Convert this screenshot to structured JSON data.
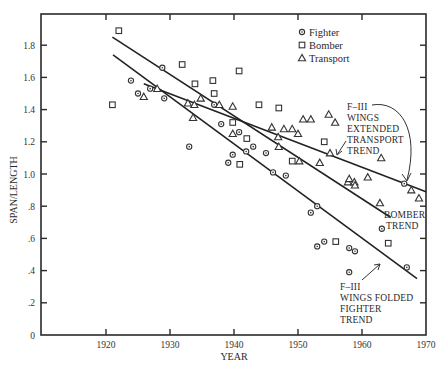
{
  "chart_data": {
    "type": "scatter",
    "title": "",
    "xlabel": "YEAR",
    "ylabel": "SPAN/LENGTH",
    "xlim": [
      1912.5,
      1970
    ],
    "ylim": [
      0,
      1.99
    ],
    "x_ticks": [
      1920,
      1930,
      1940,
      1950,
      1960,
      1970
    ],
    "x_tick_labels": [
      "1920",
      "1930",
      "1940",
      "1950",
      "1960",
      "1970"
    ],
    "y_ticks": [
      0,
      0.2,
      0.4,
      0.6,
      0.8,
      1.0,
      1.2,
      1.4,
      1.6,
      1.8
    ],
    "y_tick_labels": [
      "0",
      ".2",
      ".4",
      ".6",
      ".8",
      "1.0",
      "1.2",
      "1.4",
      "1.6",
      "1.8"
    ],
    "grid": false,
    "legend_position": "upper right (inside)",
    "legend": [
      {
        "name": "Fighter",
        "marker": "circle-dot"
      },
      {
        "name": "Bomber",
        "marker": "square"
      },
      {
        "name": "Transport",
        "marker": "triangle"
      }
    ],
    "series": [
      {
        "name": "Fighter",
        "marker": "circle-dot",
        "points": [
          [
            1923.9,
            1.58
          ],
          [
            1925.0,
            1.5
          ],
          [
            1926.9,
            1.53
          ],
          [
            1928.8,
            1.66
          ],
          [
            1929.1,
            1.47
          ],
          [
            1933.0,
            1.17
          ],
          [
            1936.9,
            1.43
          ],
          [
            1938.0,
            1.31
          ],
          [
            1940.8,
            1.26
          ],
          [
            1943.0,
            1.17
          ],
          [
            1939.8,
            1.12
          ],
          [
            1941.9,
            1.14
          ],
          [
            1939.1,
            1.07
          ],
          [
            1945.0,
            1.13
          ],
          [
            1946.1,
            1.01
          ],
          [
            1948.1,
            0.99
          ],
          [
            1952.0,
            0.76
          ],
          [
            1953.0,
            0.8
          ],
          [
            1953.0,
            0.55
          ],
          [
            1954.1,
            0.58
          ],
          [
            1958.0,
            0.54
          ],
          [
            1958.9,
            0.52
          ],
          [
            1958.0,
            0.39
          ],
          [
            1963.1,
            0.66
          ],
          [
            1966.6,
            0.94
          ],
          [
            1967.0,
            0.42
          ]
        ]
      },
      {
        "name": "Bomber",
        "marker": "square",
        "points": [
          [
            1921.0,
            1.43
          ],
          [
            1922.0,
            1.89
          ],
          [
            1931.9,
            1.68
          ],
          [
            1933.9,
            1.56
          ],
          [
            1936.7,
            1.58
          ],
          [
            1936.9,
            1.5
          ],
          [
            1940.8,
            1.64
          ],
          [
            1939.8,
            1.32
          ],
          [
            1942.0,
            1.22
          ],
          [
            1940.9,
            1.06
          ],
          [
            1943.9,
            1.43
          ],
          [
            1947.0,
            1.41
          ],
          [
            1949.1,
            1.08
          ],
          [
            1954.1,
            1.2
          ],
          [
            1955.9,
            0.58
          ],
          [
            1964.1,
            0.57
          ]
        ]
      },
      {
        "name": "Transport",
        "marker": "triangle",
        "points": [
          [
            1925.9,
            1.48
          ],
          [
            1928.0,
            1.53
          ],
          [
            1932.8,
            1.44
          ],
          [
            1933.8,
            1.43
          ],
          [
            1933.6,
            1.35
          ],
          [
            1934.8,
            1.47
          ],
          [
            1937.7,
            1.43
          ],
          [
            1939.8,
            1.42
          ],
          [
            1939.8,
            1.25
          ],
          [
            1945.9,
            1.29
          ],
          [
            1946.9,
            1.23
          ],
          [
            1947.8,
            1.28
          ],
          [
            1949.1,
            1.28
          ],
          [
            1950.0,
            1.25
          ],
          [
            1947.0,
            1.17
          ],
          [
            1950.2,
            1.08
          ],
          [
            1950.8,
            1.34
          ],
          [
            1952.0,
            1.34
          ],
          [
            1953.4,
            1.07
          ],
          [
            1954.8,
            1.37
          ],
          [
            1955.8,
            1.32
          ],
          [
            1955.0,
            1.13
          ],
          [
            1957.8,
            0.95
          ],
          [
            1958.8,
            0.95
          ],
          [
            1958.9,
            0.93
          ],
          [
            1960.9,
            0.98
          ],
          [
            1958.0,
            0.97
          ],
          [
            1962.8,
            0.82
          ],
          [
            1963.0,
            1.1
          ],
          [
            1967.7,
            0.9
          ],
          [
            1968.9,
            0.85
          ]
        ]
      }
    ],
    "trend_lines": [
      {
        "name": "Bomber trend",
        "from": [
          1921.0,
          1.85
        ],
        "to": [
          1964.5,
          0.73
        ]
      },
      {
        "name": "Fighter trend",
        "from": [
          1921.1,
          1.74
        ],
        "to": [
          1968.6,
          0.35
        ]
      },
      {
        "name": "Transport trend",
        "from": [
          1925.9,
          1.56
        ],
        "to": [
          1970.0,
          0.89
        ]
      }
    ],
    "annotations": [
      {
        "lines": [
          "F–III",
          "WINGS",
          "EXTENDED",
          "TRANSPORT",
          "TREND"
        ],
        "points_to": [
          "F-111 fighter point (1966.6, 0.94)",
          "transport trend line"
        ]
      },
      {
        "lines": [
          "BOMBER",
          "TREND"
        ],
        "points_to": [
          "bomber trend line end"
        ]
      },
      {
        "lines": [
          "F–III",
          "WINGS FOLDED",
          "FIGHTER",
          "TREND"
        ],
        "points_to": [
          "fighter trend line"
        ]
      }
    ]
  }
}
